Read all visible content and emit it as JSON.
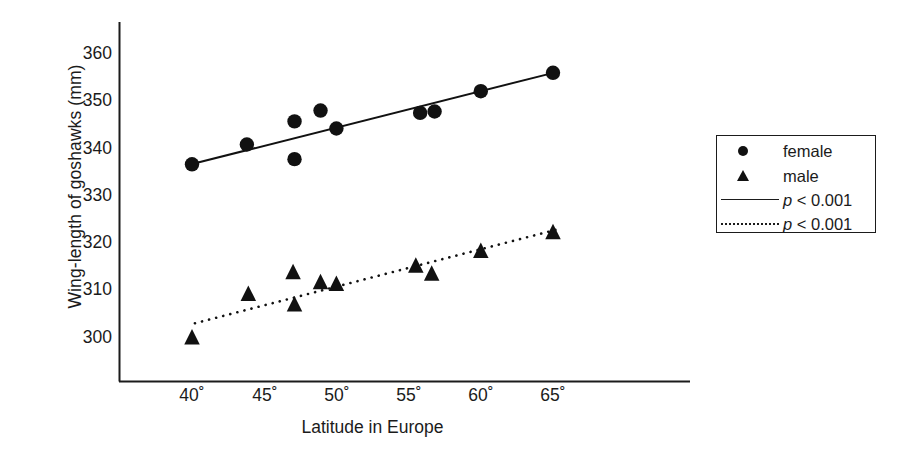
{
  "chart_data": {
    "type": "scatter",
    "title": "",
    "xlabel": "Latitude in Europe",
    "ylabel": "Wing-length of goshawks (mm)",
    "xlim": [
      37,
      75
    ],
    "ylim": [
      294,
      364
    ],
    "grid": false,
    "xticks": [
      "40˚",
      "45˚",
      "50˚",
      "55˚",
      "60˚",
      "65˚"
    ],
    "xtick_values": [
      40,
      45,
      50,
      55,
      60,
      65
    ],
    "yticks": [
      "300",
      "310",
      "320",
      "330",
      "340",
      "350",
      "360"
    ],
    "ytick_values": [
      300,
      310,
      320,
      330,
      340,
      350,
      360
    ],
    "series": [
      {
        "name": "female",
        "marker": "circle",
        "color": "#111111",
        "x": [
          40.0,
          43.8,
          47.1,
          47.1,
          48.9,
          50.0,
          55.8,
          56.8,
          60.0,
          65.0
        ],
        "y": [
          336.4,
          340.6,
          345.5,
          337.5,
          347.8,
          344.0,
          347.3,
          347.6,
          351.9,
          355.8
        ]
      },
      {
        "name": "male",
        "marker": "triangle",
        "color": "#111111",
        "x": [
          40.0,
          43.9,
          47.0,
          47.1,
          48.9,
          50.0,
          55.5,
          56.6,
          60.0,
          65.0
        ],
        "y": [
          299.6,
          308.8,
          313.4,
          306.6,
          311.3,
          310.9,
          314.8,
          313.1,
          317.9,
          321.9
        ]
      }
    ],
    "fits": [
      {
        "name": "female-trend",
        "style": "solid",
        "p_label": "p < 0.001",
        "x": [
          39.8,
          65.3
        ],
        "y": [
          336.3,
          356.0
        ]
      },
      {
        "name": "male-trend",
        "style": "dotted",
        "p_label": "p < 0.001",
        "x": [
          40.2,
          65.3
        ],
        "y": [
          302.7,
          322.6
        ]
      }
    ],
    "legend_position": "right-outside",
    "legend_entries": [
      {
        "key": "circle-marker",
        "label": "female"
      },
      {
        "key": "triangle-marker",
        "label": "male"
      },
      {
        "key": "solid-line",
        "label_italic": "p",
        "label_rest": " < 0.001"
      },
      {
        "key": "dotted-line",
        "label_italic": "p",
        "label_rest": " < 0.001"
      }
    ]
  },
  "axes": {
    "y_title": "Wing-length of goshawks (mm)",
    "x_title": "Latitude in Europe",
    "y_tick_labels": [
      "360",
      "350",
      "340",
      "330",
      "320",
      "310",
      "300"
    ],
    "x_tick_labels": [
      "40˚",
      "45˚",
      "50˚",
      "55˚",
      "60˚",
      "65˚"
    ],
    "axis_color": "#1b1b1b"
  },
  "legend": {
    "female_label": "female",
    "male_label": "male",
    "solid_p_italic": "p",
    "solid_p_rest": " < 0.001",
    "dotted_p_italic": "p",
    "dotted_p_rest": " < 0.001"
  },
  "colors": {
    "marker": "#111111",
    "axis": "#1b1b1b",
    "background": "#ffffff"
  }
}
